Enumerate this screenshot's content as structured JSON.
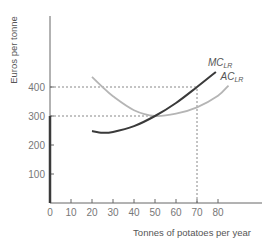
{
  "chart_data": {
    "type": "line",
    "title": "",
    "xlabel": "Tonnes of potatoes per year",
    "ylabel": "Euros per tonne",
    "xlim": [
      0,
      100
    ],
    "ylim": [
      0,
      640
    ],
    "x_ticks": [
      0,
      10,
      20,
      30,
      40,
      50,
      60,
      70,
      80
    ],
    "y_ticks": [
      100,
      200,
      300,
      400
    ],
    "grid": false,
    "series": [
      {
        "name": "MC_LR",
        "label_main": "MC",
        "label_sub": "LR",
        "color": "#3a3a3a",
        "x": [
          20,
          25,
          30,
          40,
          50,
          60,
          70,
          79
        ],
        "y": [
          248,
          242,
          245,
          265,
          300,
          345,
          400,
          452
        ]
      },
      {
        "name": "AC_LR",
        "label_main": "AC",
        "label_sub": "LR",
        "color": "#b5b5b5",
        "x": [
          20,
          25,
          30,
          40,
          50,
          60,
          70,
          80,
          85
        ],
        "y": [
          435,
          400,
          368,
          320,
          300,
          308,
          330,
          370,
          405
        ]
      }
    ],
    "annotations": [
      {
        "type": "hline-dashed",
        "y": 400,
        "x_from": 0,
        "x_to": 70
      },
      {
        "type": "hline-dashed",
        "y": 300,
        "x_from": 0,
        "x_to": 50
      },
      {
        "type": "vline-dashed",
        "x": 70,
        "y_from": 0,
        "y_to": 400
      },
      {
        "type": "bold-segment-y-axis",
        "y_from": 0,
        "y_to": 300,
        "note": "long-run supply below minimum AC"
      }
    ]
  }
}
